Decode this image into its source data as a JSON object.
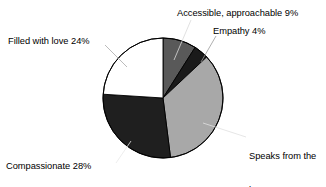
{
  "chart_data": {
    "type": "pie",
    "title": "",
    "subtitle": "",
    "xlabel": "",
    "ylabel": "",
    "grid": false,
    "legend_position": "none",
    "label_style": "outside-with-leader-lines",
    "start_angle_deg": 0,
    "direction": "clockwise",
    "units": "percent",
    "total": 100,
    "categories": [
      "Accessible, approachable",
      "Empathy",
      "Speaks from the heart",
      "Compassionate",
      "Filled with love"
    ],
    "values": [
      9,
      4,
      35,
      28,
      24
    ],
    "slices": [
      {
        "label": "Accessible, approachable",
        "value": 9,
        "value_text": "9%",
        "label_text": "Accessible, approachable 9%",
        "color": "#595959",
        "stroke": "#000000"
      },
      {
        "label": "Empathy",
        "value": 4,
        "value_text": "4%",
        "label_text": "Empathy 4%",
        "color": "#1a1a1a",
        "stroke": "#000000"
      },
      {
        "label": "Speaks from the heart",
        "value": 35,
        "value_text": "35%",
        "label_text": "Speaks from the heart 35%",
        "label_line1": "Speaks from the",
        "label_line2": "heart 35%",
        "color": "#a8a8a8",
        "stroke": "#000000"
      },
      {
        "label": "Compassionate",
        "value": 28,
        "value_text": "28%",
        "label_text": "Compassionate 28%",
        "color": "#1f1f1f",
        "stroke": "#000000"
      },
      {
        "label": "Filled with love",
        "value": 24,
        "value_text": "24%",
        "label_text": "Filled with love 24%",
        "color": "#ffffff",
        "stroke": "#000000"
      }
    ],
    "colors": [
      "#595959",
      "#1a1a1a",
      "#a8a8a8",
      "#1f1f1f",
      "#ffffff"
    ],
    "background_color": "#ffffff",
    "text_color": "#000000"
  },
  "labels": {
    "accessible": "Accessible, approachable 9%",
    "empathy": "Empathy 4%",
    "filled_with_love": "Filled with love 24%",
    "compassionate": "Compassionate 28%",
    "speaks_from_heart_line1": "Speaks from the",
    "speaks_from_heart_line2": "heart 35%"
  }
}
